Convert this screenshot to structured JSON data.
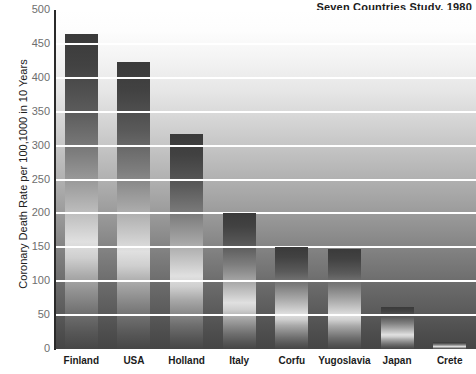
{
  "chart_data": {
    "type": "bar",
    "title": "Seven Countries Study, 1980",
    "xlabel": "",
    "ylabel": "Coronary Death Rate per 100,1000 in 10 Years",
    "categories": [
      "Finland",
      "USA",
      "Holland",
      "Italy",
      "Corfu",
      "Yugoslavia",
      "Japan",
      "Crete"
    ],
    "values": [
      465,
      423,
      317,
      200,
      150,
      147,
      62,
      10
    ],
    "ylim": [
      0,
      500
    ],
    "yticks": [
      0,
      50,
      100,
      150,
      200,
      250,
      300,
      350,
      400,
      450,
      500
    ],
    "ytick_labels": [
      "0",
      "50",
      "100",
      "150",
      "200",
      "250",
      "300",
      "350",
      "400",
      "450",
      "500"
    ],
    "grid": true,
    "gridline_color": "#ffffff",
    "legend": null,
    "legend_position": "none",
    "bar_color": "#5a5a5a",
    "background_gradient": [
      "#ffffff",
      "#454545"
    ],
    "annotations": []
  },
  "figure": {
    "watermark_text": "",
    "axis_color": "#2a2a2a",
    "tick_label_color": "#6e6e6e",
    "title_color": "#1b1b1b"
  }
}
